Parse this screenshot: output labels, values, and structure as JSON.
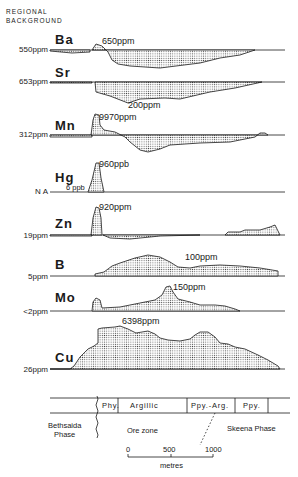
{
  "header": {
    "line1": "REGIONAL",
    "line2": "BACKGROUND"
  },
  "profiles": [
    {
      "element": "Ba",
      "background": "550ppm",
      "peak": "650ppm"
    },
    {
      "element": "Sr",
      "background": "653ppm",
      "peak": "200ppm"
    },
    {
      "element": "Mn",
      "background": "312ppm",
      "peak": "9970ppm"
    },
    {
      "element": "Hg",
      "background": "N A",
      "sub_label": "6 ppb",
      "peak": "960ppb"
    },
    {
      "element": "Zn",
      "background": "19ppm",
      "peak": "920ppm"
    },
    {
      "element": "B",
      "background": "5ppm",
      "peak": "100ppm"
    },
    {
      "element": "Mo",
      "background": "<2ppm",
      "peak": "150ppm"
    },
    {
      "element": "Cu",
      "background": "26ppm",
      "peak": "6398ppm"
    }
  ],
  "zones": {
    "phy": "Phy.",
    "argillic": "Argillic",
    "ppy_arg": "Ppy.-Arg.",
    "ppy": "Ppy."
  },
  "phases": {
    "left_line1": "Bethsaida",
    "left_line2": "Phase",
    "ore": "Ore zone",
    "right": "Skeena Phase"
  },
  "scale": {
    "t0": "0",
    "t500": "500",
    "t1000": "1000",
    "unit": "metres"
  },
  "colors": {
    "ink": "#1a1a1a",
    "stipple": "#555555",
    "background": "#ffffff"
  }
}
